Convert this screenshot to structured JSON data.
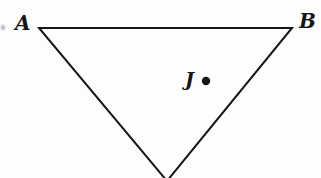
{
  "figure": {
    "type": "geometry-diagram",
    "background_color": "#fdfdfd",
    "stroke_color": "#151515",
    "stroke_width": 2,
    "width": 321,
    "height": 178
  },
  "labels": {
    "a": "A",
    "b": "B",
    "j": "J"
  },
  "chart_data": {
    "type": "diagram",
    "title": "",
    "shapes": [
      {
        "name": "triangle",
        "kind": "polygon",
        "points": [
          [
            39,
            28
          ],
          [
            292,
            28
          ],
          [
            167,
            181
          ]
        ],
        "filled": false,
        "stroke": "#151515",
        "stroke_width": 2
      },
      {
        "name": "point-j",
        "kind": "dot",
        "center": [
          206,
          81
        ],
        "radius": 4.2,
        "fill": "#151515"
      }
    ],
    "annotations": [
      {
        "text": "A",
        "position": [
          24,
          23
        ],
        "anchor": "vertex-left",
        "style": "italic-serif-bold"
      },
      {
        "text": "B",
        "position": [
          307,
          21
        ],
        "anchor": "vertex-right",
        "style": "italic-serif-bold"
      },
      {
        "text": "J",
        "position": [
          190,
          81
        ],
        "anchor": "interior-point",
        "style": "italic-serif-bold"
      }
    ]
  }
}
